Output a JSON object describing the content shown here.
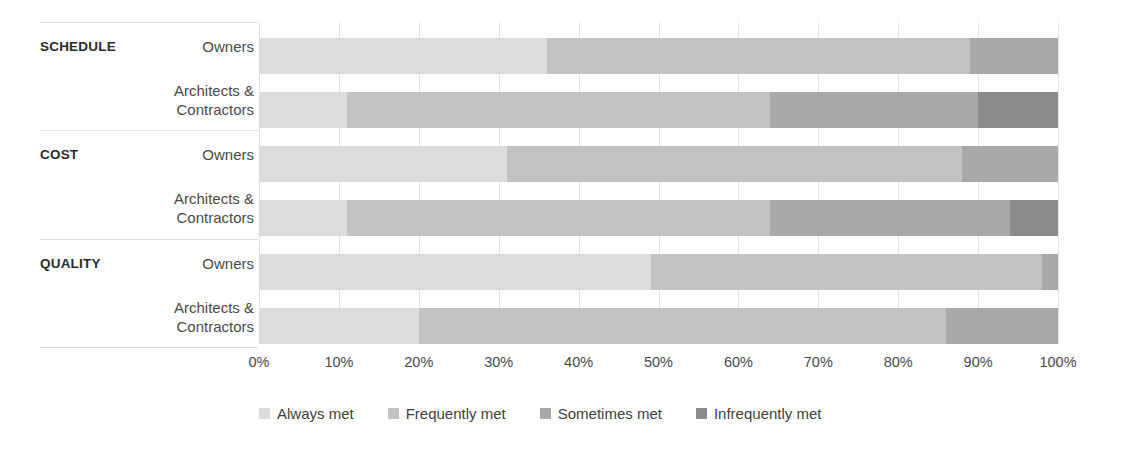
{
  "chart_data": {
    "type": "bar",
    "orientation": "horizontal",
    "stacked": true,
    "stack_mode": "percent",
    "title": "",
    "xlabel": "",
    "ylabel": "",
    "xlim": [
      0,
      100
    ],
    "grid": true,
    "legend_position": "bottom",
    "xtick_labels": [
      "0%",
      "10%",
      "20%",
      "30%",
      "40%",
      "50%",
      "60%",
      "70%",
      "80%",
      "90%",
      "100%"
    ],
    "xtick_values": [
      0,
      10,
      20,
      30,
      40,
      50,
      60,
      70,
      80,
      90,
      100
    ],
    "groups": [
      {
        "name": "SCHEDULE",
        "rows": [
          {
            "label": "Owners",
            "values": [
              36,
              53,
              11,
              0
            ]
          },
          {
            "label": "Architects &\nContractors",
            "values": [
              11,
              53,
              26,
              10
            ]
          }
        ]
      },
      {
        "name": "COST",
        "rows": [
          {
            "label": "Owners",
            "values": [
              31,
              57,
              12,
              0
            ]
          },
          {
            "label": "Architects &\nContractors",
            "values": [
              11,
              53,
              30,
              6
            ]
          }
        ]
      },
      {
        "name": "QUALITY",
        "rows": [
          {
            "label": "Owners",
            "values": [
              49,
              49,
              2,
              0
            ]
          },
          {
            "label": "Architects &\nContractors",
            "values": [
              20,
              66,
              14,
              0
            ]
          }
        ]
      }
    ],
    "series": [
      {
        "name": "Always met",
        "color": "#dcdcdc",
        "values": [
          36,
          11,
          31,
          11,
          49,
          20
        ]
      },
      {
        "name": "Frequently met",
        "color": "#c2c2c2",
        "values": [
          53,
          53,
          57,
          53,
          49,
          66
        ]
      },
      {
        "name": "Sometimes met",
        "color": "#a8a8a8",
        "values": [
          11,
          26,
          12,
          30,
          2,
          14
        ]
      },
      {
        "name": "Infrequently met",
        "color": "#8c8c8c",
        "values": [
          0,
          10,
          0,
          6,
          0,
          0
        ]
      }
    ],
    "categories": [
      "SCHEDULE / Owners",
      "SCHEDULE / Architects & Contractors",
      "COST / Owners",
      "COST / Architects & Contractors",
      "QUALITY / Owners",
      "QUALITY / Architects & Contractors"
    ],
    "legend": [
      {
        "label": "Always met",
        "color": "#dcdcdc"
      },
      {
        "label": "Frequently met",
        "color": "#c2c2c2"
      },
      {
        "label": "Sometimes met",
        "color": "#a8a8a8"
      },
      {
        "label": "Infrequently met",
        "color": "#8c8c8c"
      }
    ],
    "colors": {
      "always_met": "#dcdcdc",
      "frequently_met": "#c2c2c2",
      "sometimes_met": "#a8a8a8",
      "infrequently_met": "#8c8c8c",
      "gridline": "#e3e3e3",
      "separator": "#dddddd",
      "text": "#3f3f3f",
      "group_text": "#2b2b2b"
    }
  }
}
